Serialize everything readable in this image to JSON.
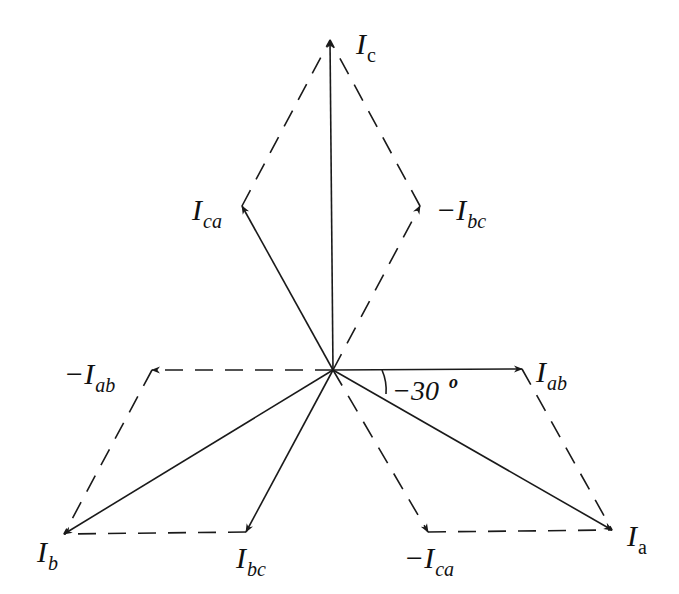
{
  "diagram": {
    "type": "phasor-diagram",
    "origin": [
      333,
      370
    ],
    "phasors": [
      {
        "id": "Ic",
        "kind": "solid",
        "from": [
          333,
          370
        ],
        "to": [
          330,
          40
        ],
        "label_main": "I",
        "label_sub": "c",
        "sub_upright": true,
        "label_pos": [
          356,
          54
        ]
      },
      {
        "id": "Ica",
        "kind": "solid",
        "from": [
          333,
          370
        ],
        "to": [
          242,
          206
        ],
        "label_main": "I",
        "label_sub": "ca",
        "sub_upright": false,
        "label_pos": [
          192,
          220
        ]
      },
      {
        "id": "neg-Ibc",
        "kind": "dashed",
        "from": [
          333,
          370
        ],
        "to": [
          420,
          206
        ],
        "label_main": "−I",
        "label_sub": "bc",
        "sub_upright": false,
        "label_pos": [
          436,
          220
        ]
      },
      {
        "id": "Iab",
        "kind": "solid",
        "from": [
          333,
          370
        ],
        "to": [
          522,
          369
        ],
        "label_main": "I",
        "label_sub": "ab",
        "sub_upright": false,
        "label_pos": [
          536,
          382
        ]
      },
      {
        "id": "neg-Iab",
        "kind": "dashed",
        "from": [
          333,
          370
        ],
        "to": [
          152,
          370
        ],
        "label_main": "−I",
        "label_sub": "ab",
        "sub_upright": false,
        "label_pos": [
          64,
          384
        ]
      },
      {
        "id": "Ia",
        "kind": "solid",
        "from": [
          333,
          370
        ],
        "to": [
          612,
          530
        ],
        "label_main": "I",
        "label_sub": "a",
        "sub_upright": true,
        "label_pos": [
          627,
          546
        ]
      },
      {
        "id": "Ib",
        "kind": "solid",
        "from": [
          333,
          370
        ],
        "to": [
          64,
          534
        ],
        "label_main": "I",
        "label_sub": "b",
        "sub_upright": false,
        "label_pos": [
          37,
          562
        ]
      },
      {
        "id": "Ibc",
        "kind": "solid",
        "from": [
          333,
          370
        ],
        "to": [
          246,
          532
        ],
        "label_main": "I",
        "label_sub": "bc",
        "sub_upright": false,
        "label_pos": [
          236,
          568
        ]
      },
      {
        "id": "neg-Ica",
        "kind": "dashed",
        "from": [
          333,
          370
        ],
        "to": [
          428,
          532
        ],
        "label_main": "−I",
        "label_sub": "ca",
        "sub_upright": false,
        "label_pos": [
          404,
          568
        ]
      }
    ],
    "construction_lines": [
      {
        "from": [
          242,
          206
        ],
        "to": [
          330,
          40
        ]
      },
      {
        "from": [
          420,
          206
        ],
        "to": [
          330,
          40
        ]
      },
      {
        "from": [
          152,
          370
        ],
        "to": [
          64,
          534
        ]
      },
      {
        "from": [
          246,
          532
        ],
        "to": [
          64,
          534
        ]
      },
      {
        "from": [
          522,
          369
        ],
        "to": [
          612,
          530
        ]
      },
      {
        "from": [
          428,
          532
        ],
        "to": [
          612,
          530
        ]
      }
    ],
    "angle_annotation": {
      "label": "−30",
      "degree_symbol": "o",
      "value_deg": -30,
      "between": [
        "Iab",
        "Ia"
      ],
      "label_pos": [
        390,
        400
      ]
    },
    "colors": {
      "line": "#1a1a1a",
      "background": "#ffffff"
    }
  }
}
